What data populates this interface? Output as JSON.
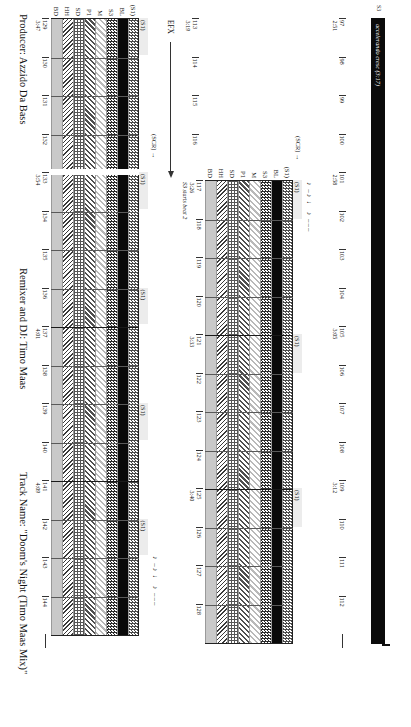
{
  "figure": {
    "title_unrendered": "",
    "rotation_note": "90deg"
  },
  "captions": {
    "producer": "Producer: Azzido Da Bass",
    "remixer": "Remixer and DJ: Timo Maas",
    "track": "Track Name: \"Doom's Night (Timo Maas Mix)\""
  },
  "lane_labels": [
    "(S1)",
    "BL",
    "S3",
    "M",
    "P1",
    "SD",
    "HH",
    "BD"
  ],
  "lane_patterns": [
    "p-s1",
    "p-bl",
    "p-s3",
    "p-m",
    "p-p1",
    "p-sd",
    "p-hh",
    "p-bd"
  ],
  "efx": {
    "label": "EFX",
    "scr_label": "(SCR) →"
  },
  "accelerando": {
    "label": "S3",
    "text": "accelerando cresc (3:17)"
  },
  "annotations": {
    "s3_starts": "S3 starts beat 2"
  },
  "s1_tag": "(S1)",
  "glyph_row": "♪ –♪ ♩ ♪ –––",
  "systems": [
    {
      "name": "system-1-numbers-only",
      "bars": [
        {
          "n": "97",
          "time": "2:51"
        },
        {
          "n": "98",
          "time": ""
        },
        {
          "n": "99",
          "time": ""
        },
        {
          "n": "100",
          "time": ""
        },
        {
          "n": "101",
          "time": "2:58"
        },
        {
          "n": "102",
          "time": ""
        },
        {
          "n": "103",
          "time": ""
        },
        {
          "n": "104",
          "time": ""
        },
        {
          "n": "105",
          "time": "3:05"
        },
        {
          "n": "106",
          "time": ""
        },
        {
          "n": "107",
          "time": ""
        },
        {
          "n": "108",
          "time": ""
        },
        {
          "n": "109",
          "time": "3:12"
        },
        {
          "n": "110",
          "time": ""
        },
        {
          "n": "111",
          "time": ""
        },
        {
          "n": "112",
          "time": ""
        }
      ]
    },
    {
      "name": "system-2",
      "lead_bars": [
        {
          "n": "113",
          "time": "3:19"
        },
        {
          "n": "114",
          "time": ""
        },
        {
          "n": "115",
          "time": ""
        },
        {
          "n": "116",
          "time": ""
        }
      ],
      "bars": [
        {
          "n": "117",
          "time": "3:26"
        },
        {
          "n": "118",
          "time": ""
        },
        {
          "n": "119",
          "time": ""
        },
        {
          "n": "120",
          "time": ""
        },
        {
          "n": "121",
          "time": "3:33"
        },
        {
          "n": "122",
          "time": ""
        },
        {
          "n": "123",
          "time": ""
        },
        {
          "n": "124",
          "time": ""
        },
        {
          "n": "125",
          "time": "3:40"
        },
        {
          "n": "126",
          "time": ""
        },
        {
          "n": "127",
          "time": ""
        },
        {
          "n": "128",
          "time": ""
        }
      ]
    },
    {
      "name": "system-3",
      "bars": [
        {
          "n": "129",
          "time": "3:47"
        },
        {
          "n": "130",
          "time": ""
        },
        {
          "n": "131",
          "time": ""
        },
        {
          "n": "132",
          "time": ""
        },
        {
          "n": "133",
          "time": "3:54"
        },
        {
          "n": "134",
          "time": ""
        },
        {
          "n": "135",
          "time": ""
        },
        {
          "n": "136",
          "time": ""
        },
        {
          "n": "137",
          "time": "4:01"
        },
        {
          "n": "138",
          "time": ""
        },
        {
          "n": "139",
          "time": ""
        },
        {
          "n": "140",
          "time": ""
        },
        {
          "n": "141",
          "time": "4:09"
        },
        {
          "n": "142",
          "time": ""
        },
        {
          "n": "143",
          "time": ""
        },
        {
          "n": "144",
          "time": ""
        }
      ]
    }
  ]
}
